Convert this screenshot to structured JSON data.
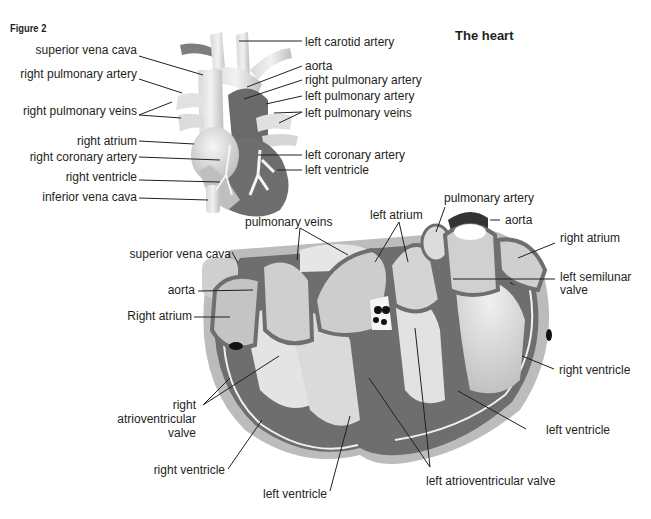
{
  "figure_label": "Figure 2",
  "title": "The heart",
  "external_view": {
    "labels_left": [
      {
        "id": "superior_vena_cava",
        "text": "superior vena cava"
      },
      {
        "id": "right_pulmonary_artery",
        "text": "right pulmonary artery"
      },
      {
        "id": "right_pulmonary_veins",
        "text": "right pulmonary veins"
      },
      {
        "id": "right_atrium",
        "text": "right atrium"
      },
      {
        "id": "right_coronary_artery",
        "text": "right coronary artery"
      },
      {
        "id": "right_ventricle",
        "text": "right ventricle"
      },
      {
        "id": "inferior_vena_cava",
        "text": "inferior vena cava"
      }
    ],
    "labels_right": [
      {
        "id": "left_carotid_artery",
        "text": "left carotid artery"
      },
      {
        "id": "aorta",
        "text": "aorta"
      },
      {
        "id": "right_pulmonary_artery",
        "text": "right pulmonary artery"
      },
      {
        "id": "left_pulmonary_artery",
        "text": "left pulmonary artery"
      },
      {
        "id": "left_pulmonary_veins",
        "text": "left pulmonary veins"
      },
      {
        "id": "left_coronary_artery",
        "text": "left coronary artery"
      },
      {
        "id": "left_ventricle",
        "text": "left ventricle"
      }
    ]
  },
  "section_view": {
    "labels": [
      {
        "id": "pulmonary_veins",
        "text": "pulmonary veins"
      },
      {
        "id": "left_atrium",
        "text": "left atrium"
      },
      {
        "id": "pulmonary_artery",
        "text": "pulmonary artery"
      },
      {
        "id": "aorta_top",
        "text": "aorta"
      },
      {
        "id": "right_atrium_right",
        "text": "right atrium"
      },
      {
        "id": "left_semilunar_valve_1",
        "text": "left semilunar"
      },
      {
        "id": "left_semilunar_valve_2",
        "text": "valve"
      },
      {
        "id": "superior_vena_cava",
        "text": "superior vena cava"
      },
      {
        "id": "aorta_left",
        "text": "aorta"
      },
      {
        "id": "right_atrium_left",
        "text": "Right atrium"
      },
      {
        "id": "right_av_valve_1",
        "text": "right"
      },
      {
        "id": "right_av_valve_2",
        "text": "atrioventricular"
      },
      {
        "id": "right_av_valve_3",
        "text": "valve"
      },
      {
        "id": "right_ventricle_left",
        "text": "right ventricle"
      },
      {
        "id": "left_ventricle_bottom",
        "text": "left ventricle"
      },
      {
        "id": "left_av_valve",
        "text": "left atrioventricular valve"
      },
      {
        "id": "left_ventricle_right",
        "text": "left ventricle"
      },
      {
        "id": "right_ventricle_right",
        "text": "right ventricle"
      }
    ]
  },
  "colors": {
    "dark_muscle": "#6e6e6e",
    "mid_gray": "#9a9a9a",
    "light_gray": "#c9c9c9",
    "pale": "#e6e6e6",
    "line": "#231f20"
  }
}
